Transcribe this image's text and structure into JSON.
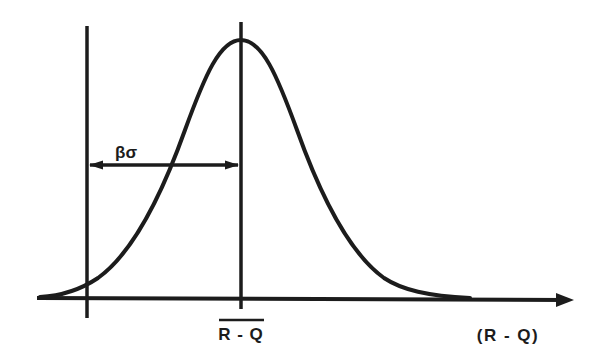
{
  "diagram": {
    "type": "normal-distribution-reliability",
    "colors": {
      "stroke": "#1c1c1c",
      "background": "#ffffff"
    },
    "labels": {
      "beta_sigma": "βσ",
      "mean": "R - Q",
      "x_axis": "(R - Q)"
    },
    "elements": {
      "curve": "bell-shaped normal distribution curve",
      "left_vertical_line": "limit line at R - Q = 0",
      "center_vertical_line": "mean line at mean of R - Q",
      "double_arrow": "distance βσ between limit and mean",
      "x_axis_arrow": "horizontal axis with arrow pointing right"
    }
  }
}
